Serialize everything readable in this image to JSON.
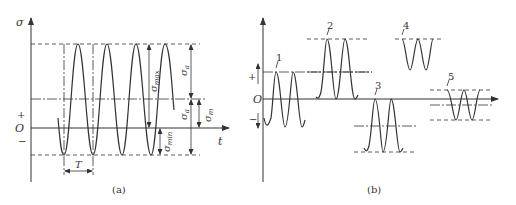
{
  "panel_a": {
    "caption": "(a)",
    "y_axis_label": "σ",
    "x_axis_label": "t",
    "origin_label": "O",
    "plus_label": "+",
    "minus_label": "−",
    "period_label": "T",
    "dims": {
      "sigma_max": "σ",
      "sigma_max_sub": "max",
      "sigma_min": "σ",
      "sigma_min_sub": "min",
      "sigma_a_top": "σ",
      "sigma_a_top_sub": "a",
      "sigma_a_bottom": "σ",
      "sigma_a_bottom_sub": "a",
      "sigma_m": "σ",
      "sigma_m_sub": "m"
    }
  },
  "panel_b": {
    "caption": "(b)",
    "origin_label": "O",
    "plus_label": "+",
    "minus_label": "−",
    "curve_labels": [
      "1",
      "2",
      "3",
      "4",
      "5"
    ]
  },
  "colors": {
    "line": "#333333",
    "background": "#ffffff"
  }
}
